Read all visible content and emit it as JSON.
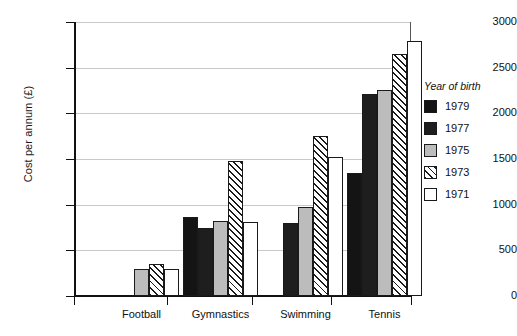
{
  "chart_data": {
    "type": "bar",
    "title": "",
    "subtitle": "",
    "xlabel": "",
    "ylabel": "Cost per annum (£)",
    "ylim": [
      0,
      3000
    ],
    "ytick_step": 500,
    "yticks": [
      "0",
      "500",
      "1000",
      "1500",
      "2000",
      "2500",
      "3000"
    ],
    "grid": "horizontal",
    "legend_position": "right",
    "legend_title": "Year of birth",
    "categories": [
      "Football",
      "Gymnastics",
      "Swimming",
      "Tennis"
    ],
    "series": [
      {
        "name": "1979",
        "style": "solid-black",
        "color": "#141414",
        "values": [
          null,
          860,
          null,
          1350
        ]
      },
      {
        "name": "1977",
        "style": "solid-black",
        "color": "#1e1e1e",
        "values": [
          null,
          750,
          800,
          2210
        ]
      },
      {
        "name": "1975",
        "style": "solid-gray",
        "color": "#bcbcbc",
        "values": [
          300,
          820,
          970,
          2260
        ]
      },
      {
        "name": "1973",
        "style": "diagonal-hatch",
        "color": "#ffffff",
        "values": [
          350,
          1480,
          1750,
          2650
        ]
      },
      {
        "name": "1971",
        "style": "solid-white",
        "color": "#ffffff",
        "values": [
          300,
          810,
          1520,
          2790
        ]
      }
    ]
  },
  "legend": {
    "title": "Year of birth",
    "items": [
      {
        "label": "1979",
        "swatch": "swatch-solid-black"
      },
      {
        "label": "1977",
        "swatch": "swatch-solid-black"
      },
      {
        "label": "1975",
        "swatch": "swatch-solid-gray"
      },
      {
        "label": "1973",
        "swatch": "swatch-diagonal-hatch"
      },
      {
        "label": "1971",
        "swatch": "swatch-solid-white"
      }
    ]
  },
  "axes": {
    "y_title": "Cost per annum (£)",
    "y_ticks": [
      "3000",
      "2500",
      "2000",
      "1500",
      "1000",
      "500",
      "0"
    ],
    "x_ticks": [
      "Football",
      "Gymnastics",
      "Swimming",
      "Tennis"
    ]
  }
}
